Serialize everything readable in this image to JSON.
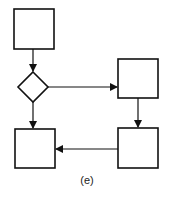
{
  "diagram": {
    "type": "flowchart",
    "caption": "(e)",
    "colors": {
      "stroke": "#111111",
      "background": "#ffffff"
    },
    "nodes": [
      {
        "id": "box-top-left",
        "shape": "rectangle",
        "label": ""
      },
      {
        "id": "decision",
        "shape": "diamond",
        "label": ""
      },
      {
        "id": "box-top-right",
        "shape": "rectangle",
        "label": ""
      },
      {
        "id": "box-bottom-right",
        "shape": "rectangle",
        "label": ""
      },
      {
        "id": "box-bottom-left",
        "shape": "rectangle",
        "label": ""
      }
    ],
    "edges": [
      {
        "from": "box-top-left",
        "to": "decision"
      },
      {
        "from": "decision",
        "to": "box-top-right"
      },
      {
        "from": "decision",
        "to": "box-bottom-left"
      },
      {
        "from": "box-top-right",
        "to": "box-bottom-right"
      },
      {
        "from": "box-bottom-right",
        "to": "box-bottom-left"
      }
    ]
  }
}
